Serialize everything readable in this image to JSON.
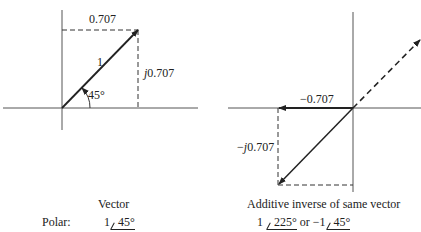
{
  "left": {
    "horizontal_label": "0.707",
    "magnitude_label": "1",
    "vertical_j": "j",
    "vertical_value": "0.707",
    "angle_label": "45°",
    "caption": "Vector",
    "polar_label": "Polar:",
    "polar_mag": "1",
    "polar_angle": "45°"
  },
  "right": {
    "horizontal_label": "−0.707",
    "vertical_prefix": "−",
    "vertical_j": "j",
    "vertical_value": "0.707",
    "caption": "Additive inverse of same vector",
    "polar1_mag": "1",
    "polar1_angle": "225°",
    "or_text": "or",
    "polar2_mag": "−1",
    "polar2_angle": "45°"
  },
  "colors": {
    "line": "#222222",
    "axis": "#555555"
  }
}
